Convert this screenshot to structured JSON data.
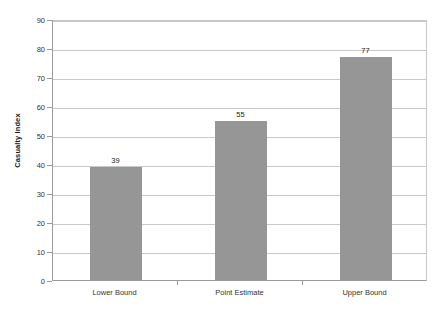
{
  "chart_data": {
    "type": "bar",
    "title": "",
    "subtitle": "",
    "xlabel": "",
    "ylabel": "Casualty Index",
    "categories": [
      "Lower Bound",
      "Point Estimate",
      "Upper Bound"
    ],
    "values": [
      39,
      55,
      77
    ],
    "data_labels": [
      "39",
      "55",
      "77"
    ],
    "ylim": [
      0,
      90
    ],
    "ytick_values": [
      0,
      10,
      20,
      30,
      40,
      50,
      60,
      70,
      80,
      90
    ],
    "ytick_labels": [
      "0",
      "10",
      "20",
      "30",
      "40",
      "50",
      "60",
      "70",
      "80",
      "90"
    ],
    "grid": "horizontal",
    "legend": "none",
    "bar_color": "#969696",
    "gridline_color": "#c8c8c8",
    "axis_color": "#9a9a9a",
    "background_color": "#ffffff"
  }
}
